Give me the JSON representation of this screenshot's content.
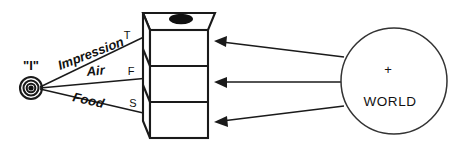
{
  "diagram": {
    "background_color": "#ffffff",
    "line_color": "#1a1a1a",
    "self": {
      "label": "\"I\"",
      "icon": "concentric-target-icon",
      "center": {
        "x": 31,
        "y": 88
      },
      "radii": [
        11,
        7.5,
        4.3
      ],
      "core_radius": 2.6
    },
    "channels": [
      {
        "id": "impression",
        "label": "Impression",
        "port": "T",
        "rotation_deg": -21
      },
      {
        "id": "air",
        "label": "Air",
        "port": "F",
        "rotation_deg": -5
      },
      {
        "id": "food",
        "label": "Food",
        "port": "S",
        "rotation_deg": 13
      }
    ],
    "box": {
      "name": "three-story-factory-box",
      "sections": 3,
      "top_marker": "black-ellipse",
      "front_face": {
        "x": 150,
        "y": 30,
        "width": 58,
        "height": 108
      },
      "depth_offset": {
        "dx": -7,
        "dy": -17
      }
    },
    "world": {
      "label": "WORLD",
      "plus": "+",
      "center": {
        "x": 394,
        "y": 81
      },
      "radius": 53
    },
    "arrows": [
      {
        "id": "arrow-top",
        "from_world": true,
        "to_port": "T"
      },
      {
        "id": "arrow-middle",
        "from_world": true,
        "to_port": "F"
      },
      {
        "id": "arrow-bottom",
        "from_world": true,
        "to_port": "S"
      }
    ]
  }
}
